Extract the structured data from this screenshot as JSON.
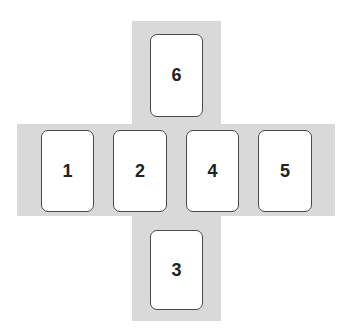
{
  "diagram": {
    "colors": {
      "band": "#d9d9d9",
      "card_fill": "#ffffff",
      "card_border": "#4a4a4a",
      "text": "#222222"
    },
    "cards": [
      {
        "label": "6",
        "position": "top"
      },
      {
        "label": "1",
        "position": "row-1"
      },
      {
        "label": "2",
        "position": "row-2"
      },
      {
        "label": "4",
        "position": "row-3"
      },
      {
        "label": "5",
        "position": "row-4"
      },
      {
        "label": "3",
        "position": "bottom"
      }
    ]
  }
}
